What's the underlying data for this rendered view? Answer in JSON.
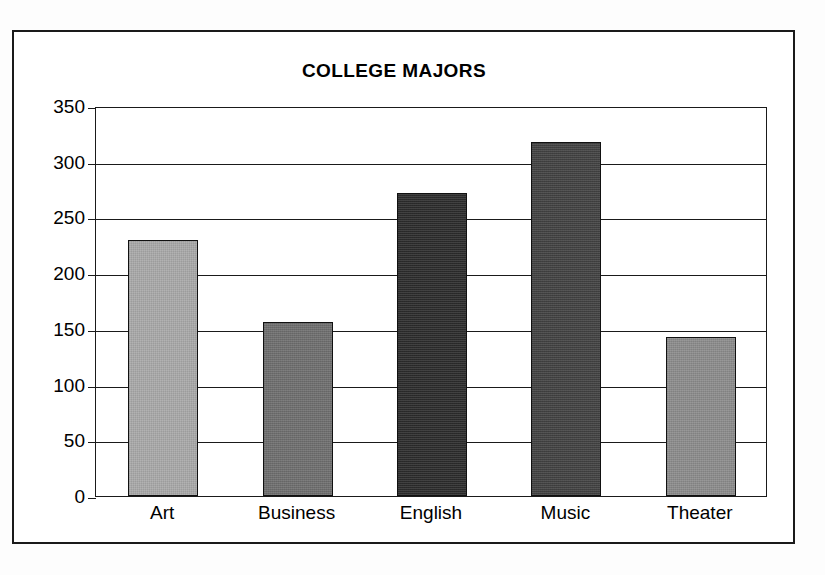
{
  "figure": {
    "title": "COLLEGE MAJORS",
    "frame_color": "#1a1a1a",
    "background_color": "#ffffff"
  },
  "chart_data": {
    "type": "bar",
    "title": "COLLEGE MAJORS",
    "xlabel": "",
    "ylabel": "",
    "categories": [
      "Art",
      "Business",
      "English",
      "Music",
      "Theater"
    ],
    "values": [
      230,
      156,
      272,
      318,
      143
    ],
    "bar_colors": [
      "#a8a8a8",
      "#6e6e6e",
      "#2b2b2b",
      "#414141",
      "#8b8b8b"
    ],
    "ylim": [
      0,
      350
    ],
    "yticks": [
      0,
      50,
      100,
      150,
      200,
      250,
      300,
      350
    ],
    "ytick_labels": [
      "0",
      "50",
      "100",
      "150",
      "200",
      "250",
      "300",
      "350"
    ],
    "grid": true,
    "grid_axis": "y",
    "legend": false,
    "legend_position": "none"
  }
}
